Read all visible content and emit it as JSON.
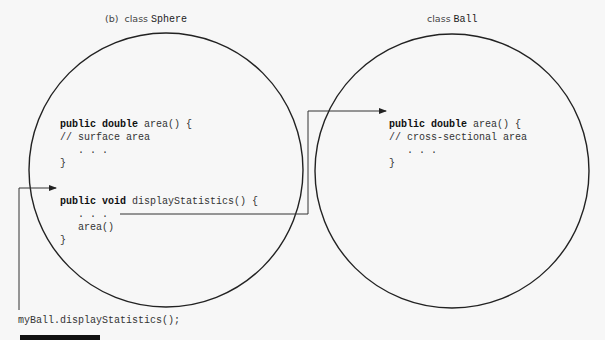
{
  "left": {
    "caption_prefix": "(b)  class ",
    "class_name": "Sphere",
    "method1": {
      "sig_kw": "public double",
      "sig_rest": " area() {",
      "comment": "// surface area",
      "dots": "   . . .",
      "close": "}"
    },
    "method2": {
      "sig_kw": "public void",
      "sig_rest": " displayStatistics() {",
      "dots": "   . . .",
      "call": "   area()",
      "close": "}"
    }
  },
  "right": {
    "caption_prefix": "class ",
    "class_name": "Ball",
    "method1": {
      "sig_kw": "public double",
      "sig_rest": " area() {",
      "comment": "// cross-sectional area",
      "dots": "   . . .",
      "close": "}"
    }
  },
  "call_statement": "myBall.displayStatistics();",
  "colors": {
    "line": "#222222",
    "background": "#f7f7f7"
  }
}
